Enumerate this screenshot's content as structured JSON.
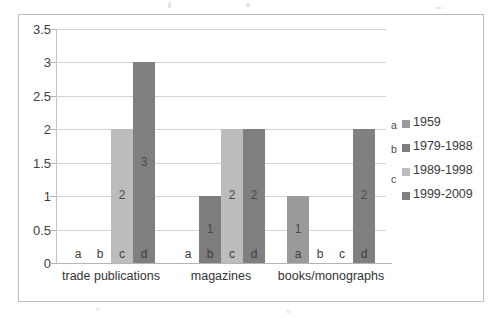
{
  "chart_data": {
    "type": "bar",
    "title": "",
    "xlabel": "",
    "ylabel": "",
    "ylim": [
      0,
      3.5
    ],
    "ytick_labels": [
      "3.5",
      "3",
      "2.5",
      "2",
      "1.5",
      "1",
      "0.5",
      "0"
    ],
    "ytick_values": [
      3.5,
      3,
      2.5,
      2,
      1.5,
      1,
      0.5,
      0
    ],
    "grid": true,
    "legend_position": "right",
    "categories": [
      "trade publications",
      "magazines",
      "books/monographs"
    ],
    "series": [
      {
        "name": "1959",
        "letter": "a",
        "color": "#9a9a9a",
        "values": [
          0,
          0,
          1
        ]
      },
      {
        "name": "1979-1988",
        "letter": "b",
        "color": "#7d7d7d",
        "values": [
          0,
          1,
          0
        ]
      },
      {
        "name": "1989-1998",
        "letter": "c",
        "color": "#bcbcbc",
        "values": [
          2,
          2,
          0
        ]
      },
      {
        "name": "1999-2009",
        "letter": "d",
        "color": "#808080",
        "values": [
          3,
          2,
          2
        ]
      }
    ],
    "bar_labels": [
      [
        "",
        "",
        "1"
      ],
      [
        "",
        "1",
        ""
      ],
      [
        "2",
        "2",
        ""
      ],
      [
        "3",
        "2",
        "2"
      ]
    ],
    "series_letters": [
      "a",
      "b",
      "c",
      "d"
    ]
  },
  "legend": {
    "entries": [
      {
        "letter": "a",
        "label": "1959"
      },
      {
        "letter": "b",
        "label": "1979-1988"
      },
      {
        "letter": "c",
        "label": "1989-1998"
      },
      {
        "letter": "",
        "label": "1999-2009"
      }
    ]
  },
  "colors": {
    "frame_border": "#b9bcc0",
    "gridline": "#d4d4d4",
    "axis": "#b5b5b5",
    "text": "#3f3f3f"
  }
}
